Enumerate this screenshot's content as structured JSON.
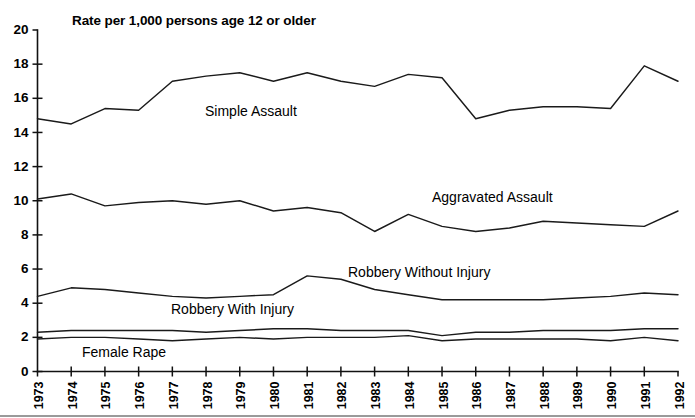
{
  "chart_data": {
    "type": "line",
    "title": "Rate per 1,000 persons age 12 or older",
    "xlabel": "",
    "ylabel": "",
    "xlim": [
      1973,
      1992
    ],
    "ylim": [
      0,
      20
    ],
    "ytick_step": 2,
    "grid": false,
    "legend_position": "inline-annotations",
    "categories": [
      "1973",
      "1974",
      "1975",
      "1976",
      "1977",
      "1978",
      "1979",
      "1980",
      "1981",
      "1982",
      "1983",
      "1984",
      "1985",
      "1986",
      "1987",
      "1988",
      "1989",
      "1990",
      "1991",
      "1992"
    ],
    "yticks": [
      "0",
      "2",
      "4",
      "6",
      "8",
      "10",
      "12",
      "14",
      "16",
      "18",
      "20"
    ],
    "series": [
      {
        "name": "Simple Assault",
        "values": [
          14.8,
          14.5,
          15.4,
          15.3,
          17.0,
          17.3,
          17.5,
          17.0,
          17.5,
          17.0,
          16.7,
          17.4,
          17.2,
          14.8,
          15.3,
          15.5,
          15.5,
          15.4,
          17.9,
          17.0
        ]
      },
      {
        "name": "Aggravated Assault",
        "values": [
          10.1,
          10.4,
          9.7,
          9.9,
          10.0,
          9.8,
          10.0,
          9.4,
          9.6,
          9.3,
          8.2,
          9.2,
          8.5,
          8.2,
          8.4,
          8.8,
          8.7,
          8.6,
          8.5,
          9.4
        ]
      },
      {
        "name": "Robbery Without Injury",
        "values": [
          4.4,
          4.9,
          4.8,
          4.6,
          4.4,
          4.3,
          4.4,
          4.5,
          5.6,
          5.4,
          4.8,
          4.5,
          4.2,
          4.2,
          4.2,
          4.2,
          4.3,
          4.4,
          4.6,
          4.5
        ]
      },
      {
        "name": "Robbery With Injury",
        "values": [
          2.3,
          2.4,
          2.4,
          2.4,
          2.4,
          2.3,
          2.4,
          2.5,
          2.5,
          2.4,
          2.4,
          2.4,
          2.1,
          2.3,
          2.3,
          2.4,
          2.4,
          2.4,
          2.5,
          2.5
        ]
      },
      {
        "name": "Female Rape",
        "values": [
          1.9,
          2.0,
          2.0,
          1.9,
          1.8,
          1.9,
          2.0,
          1.9,
          2.0,
          2.0,
          2.0,
          2.1,
          1.8,
          1.9,
          1.9,
          1.9,
          1.9,
          1.8,
          2.0,
          1.8
        ]
      }
    ],
    "annotations": [
      {
        "text": "Simple Assault",
        "x_px": 205,
        "y_px": 116
      },
      {
        "text": "Aggravated Assault",
        "x_px": 432,
        "y_px": 202
      },
      {
        "text": "Robbery Without Injury",
        "x_px": 348,
        "y_px": 277
      },
      {
        "text": "Robbery With Injury",
        "x_px": 171,
        "y_px": 314
      },
      {
        "text": "Female Rape",
        "x_px": 82,
        "y_px": 357
      }
    ]
  }
}
